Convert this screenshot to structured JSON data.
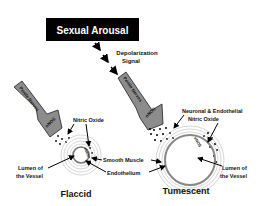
{
  "title_box": {
    "label": "Sexual Arousal"
  },
  "signal": {
    "line1": "Depolarization",
    "line2": "Signal"
  },
  "nerves": {
    "left_label": "Penile Nerves",
    "right_label": "Penile Nerves",
    "enzyme_left": "nNOS",
    "enzyme_right": "nNOS",
    "endothelial_enzyme": "eNOS"
  },
  "labels": {
    "nitric_oxide": "Nitric Oxide",
    "neuronal_line1": "Neuronal & Endothelial",
    "neuronal_line2": "Nitric Oxide",
    "smooth_muscle": "Smooth Muscle",
    "endothelium": "Endothelium",
    "lumen_left_1": "Lumen of",
    "lumen_left_2": "the Vessel",
    "lumen_right_1": "Lumen of",
    "lumen_right_2": "the Vessel"
  },
  "states": {
    "left": "Flaccid",
    "right": "Tumescent"
  },
  "colors": {
    "box": "#000000",
    "nerve": "#8c8c8c",
    "ring": "#9a9a9a",
    "text": "#111111"
  }
}
